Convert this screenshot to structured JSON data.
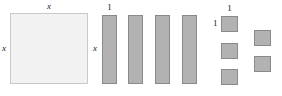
{
  "figure": {
    "type": "algebra-tiles-diagram",
    "colors": {
      "x_squared_fill": "#f2f2f2",
      "x_squared_stroke": "#c8c8c8",
      "tile_fill": "#b2b2b2",
      "tile_stroke": "#8a8a8a",
      "label_color": "#1a1a1a",
      "background": "#ffffff"
    }
  },
  "groups": {
    "x_squared": {
      "name": "x-squared-tile",
      "count": 1,
      "top_label": "x",
      "left_label": "x"
    },
    "x_tiles": {
      "name": "x-tile",
      "count": 4,
      "top_label": "1",
      "left_label": "x"
    },
    "unit_tiles": {
      "name": "unit-tile",
      "count": 5,
      "top_label": "1",
      "left_label": "1"
    }
  }
}
